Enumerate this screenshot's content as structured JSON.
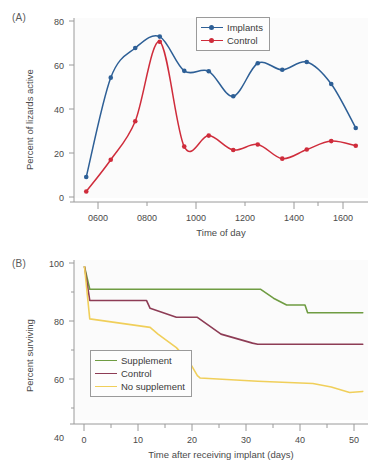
{
  "figure": {
    "panel_a_label": "(A)",
    "panel_b_label": "(B)"
  },
  "chart_data": [
    {
      "type": "line",
      "panel": "(A)",
      "title": "",
      "xlabel": "Time of day",
      "ylabel": "Percent of lizards active",
      "xlim": [
        550,
        1750
      ],
      "ylim": [
        -5,
        82
      ],
      "xticks": [
        600,
        800,
        1000,
        1200,
        1400,
        1600
      ],
      "xtick_labels": [
        "0600",
        "0800",
        "1000",
        "1200",
        "1400",
        "1600"
      ],
      "xminor": [
        700,
        900,
        1100,
        1300,
        1500,
        1700
      ],
      "yticks": [
        0,
        20,
        40,
        60,
        80
      ],
      "ytick_labels": [
        "0",
        "20",
        "40",
        "60",
        "80"
      ],
      "grid": false,
      "legend_position": "top-center",
      "x": [
        600,
        700,
        800,
        900,
        1000,
        1100,
        1200,
        1300,
        1400,
        1500,
        1600,
        1700
      ],
      "series": [
        {
          "name": "Implants",
          "color": "#2d5f96",
          "marker": "circle",
          "values": [
            6.8,
            53.8,
            67.8,
            73.2,
            57.0,
            56.8,
            45.0,
            60.6,
            57.5,
            61.2,
            50.8,
            30.0
          ]
        },
        {
          "name": "Control",
          "color": "#cf2c3b",
          "marker": "circle",
          "values": [
            0.0,
            15.0,
            33.2,
            70.8,
            21.2,
            26.4,
            19.6,
            22.2,
            15.5,
            19.8,
            23.8,
            21.6
          ]
        }
      ]
    },
    {
      "type": "line",
      "panel": "(B)",
      "title": "",
      "xlabel": "Time after receiving implant (days)",
      "ylabel": "Percent surviving",
      "xlim": [
        -2,
        54
      ],
      "ylim": [
        28,
        101
      ],
      "xticks": [
        0,
        10,
        20,
        30,
        40,
        50
      ],
      "xtick_labels": [
        "0",
        "10",
        "20",
        "30",
        "40",
        "50"
      ],
      "xminor": [
        5,
        15,
        25,
        35,
        45
      ],
      "yticks": [
        40,
        60,
        80,
        100
      ],
      "ytick_labels": [
        "40",
        "60",
        "80",
        "100"
      ],
      "yminor": [
        50,
        70,
        90
      ],
      "grid": false,
      "legend_position": "lower-left",
      "step_plot": true,
      "series": [
        {
          "name": "Supplement",
          "color": "#6f9c42",
          "x": [
            0,
            1,
            33.5,
            36,
            38.5,
            42,
            42.5,
            53
          ],
          "values": [
            98,
            88,
            88,
            84,
            81,
            81,
            77.5,
            77.5
          ]
        },
        {
          "name": "Control",
          "color": "#8d3c55",
          "x": [
            0,
            1,
            11.8,
            12.5,
            17.5,
            21.5,
            26,
            32,
            33,
            53
          ],
          "values": [
            98,
            83,
            83,
            79.5,
            75.5,
            75.5,
            68,
            64,
            63.5,
            63.5
          ]
        },
        {
          "name": "No supplement",
          "color": "#f0cf5a",
          "x": [
            0,
            1,
            12.5,
            14,
            17.5,
            20,
            21.5,
            22,
            33,
            43.5,
            47,
            50.5,
            53
          ],
          "values": [
            98,
            74.8,
            71,
            68,
            62,
            55.5,
            49.5,
            48.5,
            47,
            46,
            44.5,
            42,
            42.5
          ]
        }
      ]
    }
  ]
}
